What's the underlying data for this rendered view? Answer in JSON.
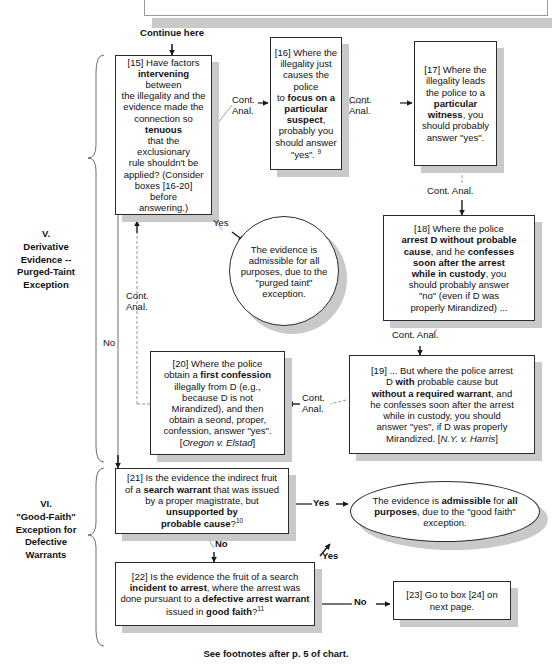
{
  "chart": {
    "title_footer": "See footnotes after p. 5 of chart.",
    "continue_label": "Continue here",
    "sections": [
      {
        "id": "section-v",
        "label": "V.\nDerivative\nEvidence --\nPurged-Taint\nException"
      },
      {
        "id": "section-vi",
        "label": "VI.\n\"Good-Faith\"\nException for\nDefective\nWarrants"
      }
    ],
    "nodes": [
      {
        "id": "box-15",
        "number": "[15]",
        "text": "[15] Have factors intervening between the illegality and the evidence made the connection so tenuous that the exclusionary rule shouldn't be applied? (Consider boxes [16-20] before answering.)"
      },
      {
        "id": "box-16",
        "number": "[16]",
        "text": "[16] Where the illegality just causes the police to focus on a particular suspect, probably you should answer \"yes\". 9"
      },
      {
        "id": "box-17",
        "number": "[17]",
        "text": "[17] Where the illegality leads the police to a particular witness, you should probably answer \"yes\"."
      },
      {
        "id": "box-18",
        "number": "[18]",
        "text": "[18] Where the police arrest D without probable cause, and he confesses soon after the arrest while in custody, you should probably answer \"no\" (even if D was properly Mirandized) ..."
      },
      {
        "id": "box-19",
        "number": "[19]",
        "text": "[19] ... But where the police arrest D with probable cause but without a required warrant, and he confesses soon after the arrest while in custody, you should answer \"yes\", if D was properly Mirandized. [N.Y. v. Harris]"
      },
      {
        "id": "box-20",
        "number": "[20]",
        "text": "[20] Where the police obtain a first confession illegally from D (e.g., because D is not Mirandized), and then obtain a seond, proper, confession, answer \"yes\". [Oregon v. Elstad]"
      },
      {
        "id": "box-21",
        "number": "[21]",
        "text": "[21] Is the evidence the indirect fruit of a search warrant that was issued by a proper magistrate, but unsupported by probable cause? 10"
      },
      {
        "id": "box-22",
        "number": "[22]",
        "text": "[22] Is the evidence the fruit of a search incident to arrest, where the arrest was done pursuant to a defective arrest warrant issued in good faith? 11"
      },
      {
        "id": "box-23",
        "number": "[23]",
        "text": "[23] Go to box [24] on next page."
      },
      {
        "id": "circle-purged-taint",
        "text": "The evidence is admissible for all purposes, due to the \"purged taint\" exception."
      },
      {
        "id": "ellipse-good-faith",
        "text": "The evidence is admissible for all purposes, due to the \"good faith\" exception."
      }
    ],
    "edge_labels": [
      {
        "id": "edge-15-16",
        "text": "Cont.\nAnal."
      },
      {
        "id": "edge-16-17",
        "text": "Cont.\nAnal."
      },
      {
        "id": "edge-17-18",
        "text": "Cont. Anal."
      },
      {
        "id": "edge-18-19",
        "text": "Cont. Anal."
      },
      {
        "id": "edge-19-20",
        "text": "Cont.\nAnal."
      },
      {
        "id": "edge-20-15",
        "text": "Cont.\nAnal."
      },
      {
        "id": "edge-15-yes",
        "text": "Yes"
      },
      {
        "id": "edge-15-no",
        "text": "No"
      },
      {
        "id": "edge-21-yes",
        "text": "Yes"
      },
      {
        "id": "edge-21-no",
        "text": "No"
      },
      {
        "id": "edge-22-yes",
        "text": "Yes"
      },
      {
        "id": "edge-22-no",
        "text": "No"
      }
    ]
  },
  "box15": {
    "l1": "[15] Have factors",
    "b1": "intervening",
    "l2": " between",
    "l3": "the illegality and the",
    "l4": "evidence made the",
    "l5": "connection so ",
    "b2": "tenuous",
    "l6": "that the exclusionary",
    "l7": "rule shouldn't be",
    "l8": "applied? (Consider",
    "l9": "boxes [16-20] before",
    "l10": "answering.)"
  },
  "box16": {
    "l1": "[16] Where the",
    "l2": "illegality just",
    "l3": "causes the police",
    "l4": "to ",
    "b1": "focus on a",
    "b2": "particular",
    "b3": "suspect",
    "l5": ",",
    "l6": "probably you",
    "l7": "should answer",
    "l8": "\"yes\". ",
    "fn": "9"
  },
  "box17": {
    "l1": "[17] Where the",
    "l2": "illegality leads",
    "l3": "the police to a",
    "b1": "particular",
    "b2": "witness",
    "l4": ", you",
    "l5": "should probably",
    "l6": "answer \"yes\"."
  },
  "box18": {
    "l1": "[18] Where the police",
    "b1": "arrest D without probable",
    "b2": "cause",
    "l2": ", and he ",
    "b3": "confesses",
    "b4": "soon after the arrest",
    "b5": "while in custody",
    "l3": ", you",
    "l4": "should probably answer",
    "l5": "\"no\" (even if D was",
    "l6": "properly Mirandized) ..."
  },
  "box19": {
    "l1": "[19] ... But where the police arrest",
    "l2": "D ",
    "b1": "with",
    "l3": " probable cause but",
    "b2": "without a required warrant",
    "l4": ", and",
    "l5": "he confesses soon after the arrest",
    "l6": "while in custody, you should",
    "l7": "answer \"yes\", if D was properly",
    "l8": "Mirandized. [",
    "i1": "N.Y. v. Harris",
    "l9": "]"
  },
  "box20": {
    "l1": "[20] Where the police",
    "l2": "obtain a ",
    "b1": "first confession",
    "l3": "illegally from D (e.g.,",
    "l4": "because D is not",
    "l5": "Mirandized), and then",
    "l6": "obtain a seond, proper,",
    "l7": "confession, answer \"yes\".",
    "l8": "[",
    "i1": "Oregon v. Elstad",
    "l9": "]"
  },
  "box21": {
    "l1": "[21] Is the evidence the indirect fruit",
    "l2": "of a ",
    "b1": "search warrant",
    "l3": " that was issued",
    "l4": "by a proper magistrate, but",
    "b2": "unsupported by",
    "b3": "probable cause",
    "l5": "?",
    "fn": "10"
  },
  "box22": {
    "l1": "[22] Is the evidence the fruit of a search",
    "b1": "incident to arrest",
    "l2": ", where the arrest was",
    "l3": "done pursuant to a ",
    "b2": "defective arrest warrant",
    "l4": "issued in ",
    "b3": "good faith",
    "l5": "?",
    "fn": "11"
  },
  "box23": {
    "l1": "[23] Go to box [24] on",
    "l2": "next page."
  },
  "circlePurged": {
    "l1": "The evidence is",
    "l2": "admissible for all",
    "l3": "purposes, due to the",
    "l4": "\"purged taint\"",
    "l5": "exception."
  },
  "ellipseGoodFaith": {
    "l1": "The evidence is ",
    "b1": "admissible",
    "l2": " for ",
    "b2": "all",
    "b3": "purposes",
    "l3": ", due to the \"good faith\"",
    "l4": "exception."
  },
  "labels": {
    "continue_here": "Continue here",
    "cont_anal_2line": "Cont.\nAnal.",
    "cont_anal_1line": "Cont. Anal.",
    "yes": "Yes",
    "no": "No",
    "section_v": "V.\nDerivative\nEvidence --\nPurged-Taint\nException",
    "section_vi": "VI.\n\"Good-Faith\"\nException for\nDefective\nWarrants",
    "footer": "See footnotes after p. 5 of chart."
  },
  "colors": {
    "border": "#2b2b2b",
    "shadow": "#c9c9c9",
    "text": "#111111",
    "background": "#ffffff"
  }
}
